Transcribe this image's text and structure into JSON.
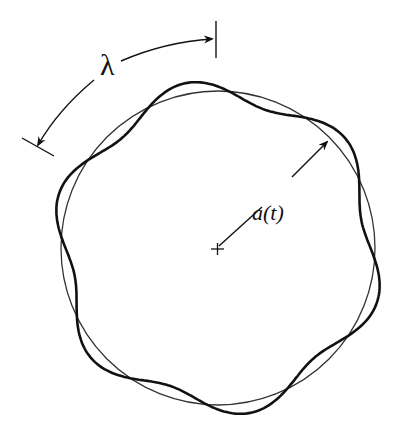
{
  "figure": {
    "labels": {
      "wavelength": "λ",
      "radius": "a(t)"
    },
    "center_marker": "+",
    "reference_circle": {
      "cx": 218,
      "cy": 248,
      "r": 157,
      "stroke": "#333333"
    },
    "perturbed_boundary": {
      "lobes": 6,
      "amplitude": 11,
      "stroke": "#111111"
    }
  }
}
